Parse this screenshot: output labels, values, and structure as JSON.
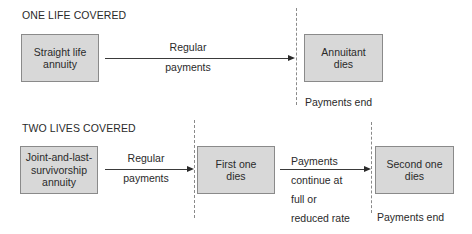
{
  "one_life": {
    "heading": "ONE LIFE COVERED",
    "start_box": [
      "Straight life",
      "annuity"
    ],
    "arrow_label": [
      "Regular",
      "payments"
    ],
    "end_box": [
      "Annuitant",
      "dies"
    ],
    "end_note": "Payments end"
  },
  "two_lives": {
    "heading": "TWO LIVES COVERED",
    "start_box": [
      "Joint-and-last-",
      "survivorship",
      "annuity"
    ],
    "arrow1_label": [
      "Regular",
      "payments"
    ],
    "middle_box": [
      "First one",
      "dies"
    ],
    "arrow2_label": [
      "Payments",
      "continue at",
      "full or",
      "reduced rate"
    ],
    "end_box": [
      "Second one",
      "dies"
    ],
    "end_note": "Payments end"
  },
  "colors": {
    "box_fill": "#d8d8d8",
    "box_border": "#8a8a8a",
    "text": "#2a2a2a",
    "dashed_line": "#8a8a8a"
  }
}
